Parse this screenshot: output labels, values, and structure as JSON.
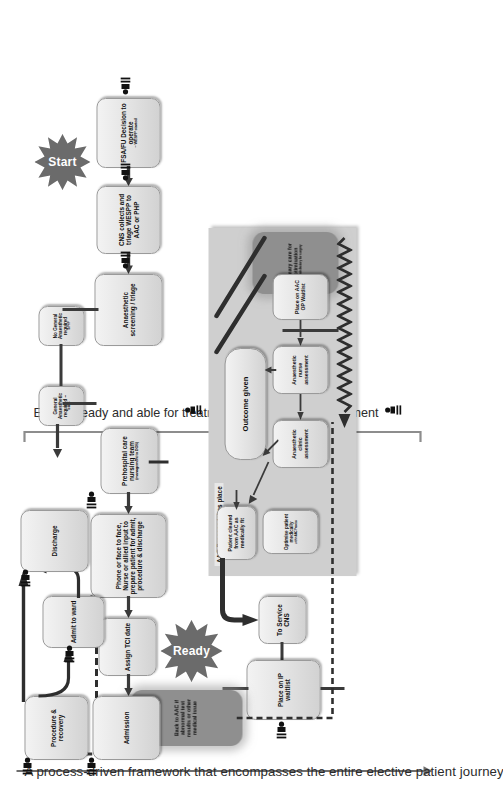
{
  "title": "A process-driven framework that encompasses the entire elective patient journey",
  "milestones": [
    {
      "id": "ensure-fit",
      "label": "Ensure fit for treatment"
    },
    {
      "id": "ensure-ready",
      "label": "Ensure ready and able for treatment"
    }
  ],
  "markers": [
    {
      "id": "start",
      "label": "Start"
    },
    {
      "id": "ready",
      "label": "Ready"
    }
  ],
  "region": {
    "label": "AAC Process takes place"
  },
  "nodes": {
    "fsa_fu": {
      "main": "FSA/FU Decision to operate",
      "sub": "– WESPP started"
    },
    "cns_collects": {
      "main": "CNS collects and triage WESPP to AAC or PHP",
      "sub": ""
    },
    "anaesthetic_screening": {
      "main": "Anaesthetic screening / triage",
      "sub": ""
    },
    "no_ga": {
      "main": "No General Anaesthetic required",
      "sub": "To PHP"
    },
    "ga_required": {
      "main": "General Anaesthetic required –",
      "sub": "To AAC"
    },
    "primary_care": {
      "main": "Primary care for optimisation",
      "sub": "if unsatisfactory for surgery"
    },
    "place_aac_op": {
      "main": "Place on AAC OP Waitlist",
      "sub": ""
    },
    "nurse_assessment": {
      "main": "Anaesthetic nurse assessment",
      "sub": ""
    },
    "clinic_assessment": {
      "main": "Anaesthetic clinic assessment",
      "sub": ""
    },
    "outcome_given": {
      "main": "Outcome given",
      "sub": ""
    },
    "optimise": {
      "main": "Optimise patient medically",
      "sub": "within AAC Process"
    },
    "cleared": {
      "main": "Patient cleared from AAC as medically fit",
      "sub": ""
    },
    "to_service_cns": {
      "main": "To Service CNS",
      "sub": ""
    },
    "place_ip_waitlist": {
      "main": "Place on IP waitlist",
      "sub": ""
    },
    "back_to_aac": {
      "main": "Back to AAC if abnormal test results or other medical issue",
      "sub": ""
    },
    "prehospital": {
      "main": "Prehospital care nursing team",
      "sub": "(management to DOS)"
    },
    "phone_face": {
      "main": "Phone or face to face, Nurse or allied input to prepare patient for admit, procedure & discharge",
      "sub": ""
    },
    "assign_tci": {
      "main": "Assign TCI date",
      "sub": ""
    },
    "admission": {
      "main": "Admission",
      "sub": ""
    },
    "procedure_recovery": {
      "main": "Procedure & recovery",
      "sub": ""
    },
    "admit_to_ward": {
      "main": "Admit to ward",
      "sub": ""
    },
    "discharge": {
      "main": "Discharge",
      "sub": ""
    }
  },
  "colors": {
    "node_fill": "#e2e2e2",
    "node_border": "#9a9a9a",
    "dark_fill": "#8f8f8f",
    "region_fill": "#cfcfcf",
    "connector": "#3a3a3a",
    "text": "#111111",
    "bracket": "#8d8d8d"
  }
}
